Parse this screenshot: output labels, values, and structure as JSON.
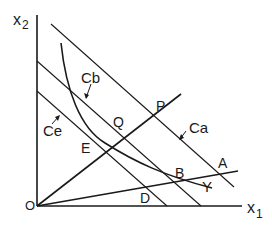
{
  "diagram": {
    "axes": {
      "x_label": "x",
      "x_sub": "1",
      "y_label": "x",
      "y_sub": "2",
      "origin_label": "O"
    },
    "lines": {
      "ca_label": "Ca",
      "cb_label": "Cb",
      "ce_label": "Ce",
      "curve_label": "Y"
    },
    "points": {
      "p": "P",
      "q": "Q",
      "e": "E",
      "a": "A",
      "b": "B",
      "d": "D"
    },
    "colors": {
      "ink": "#1a1a1a",
      "background": "#ffffff"
    }
  }
}
